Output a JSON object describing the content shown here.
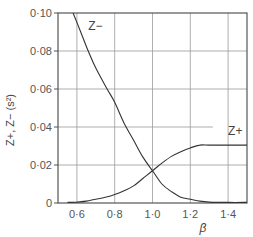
{
  "chart_data": {
    "type": "line",
    "title": "",
    "xlabel": "β",
    "ylabel": "Z+, Z− (s²)",
    "xlim": [
      0.5,
      1.5
    ],
    "ylim": [
      0,
      0.1
    ],
    "grid": true,
    "x_ticks": [
      0.6,
      0.8,
      1.0,
      1.2,
      1.4
    ],
    "x_tick_labels": [
      "0·6",
      "0·8",
      "1·0",
      "1·2",
      "1·4"
    ],
    "y_ticks": [
      0,
      0.02,
      0.04,
      0.06,
      0.08,
      0.1
    ],
    "y_tick_labels": [
      "0",
      "0·02",
      "0·04",
      "0·06",
      "0·08",
      "0·10"
    ],
    "series": [
      {
        "name": "Z−",
        "label": "Z−",
        "x": [
          0.58,
          0.62,
          0.66,
          0.7,
          0.76,
          0.8,
          0.85,
          0.9,
          0.95,
          1.0,
          1.05,
          1.1,
          1.15,
          1.2,
          1.25,
          1.3,
          1.4,
          1.5
        ],
        "values": [
          0.1,
          0.09,
          0.08,
          0.071,
          0.06,
          0.053,
          0.042,
          0.033,
          0.024,
          0.017,
          0.01,
          0.006,
          0.003,
          0.002,
          0.001,
          0.0005,
          0.0003,
          0.0003
        ]
      },
      {
        "name": "Z+",
        "label": "Z+",
        "x": [
          0.55,
          0.6,
          0.65,
          0.7,
          0.75,
          0.8,
          0.85,
          0.9,
          0.95,
          1.0,
          1.05,
          1.1,
          1.15,
          1.2,
          1.25,
          1.3,
          1.4,
          1.5
        ],
        "values": [
          0.0003,
          0.0005,
          0.001,
          0.002,
          0.003,
          0.0045,
          0.0065,
          0.009,
          0.013,
          0.017,
          0.021,
          0.0245,
          0.027,
          0.029,
          0.0305,
          0.0305,
          0.0305,
          0.0305
        ]
      }
    ],
    "annotations": [
      {
        "text": "Z−",
        "x": 0.66,
        "y": 0.091
      },
      {
        "text": "Z+",
        "x": 1.4,
        "y": 0.036
      }
    ]
  }
}
